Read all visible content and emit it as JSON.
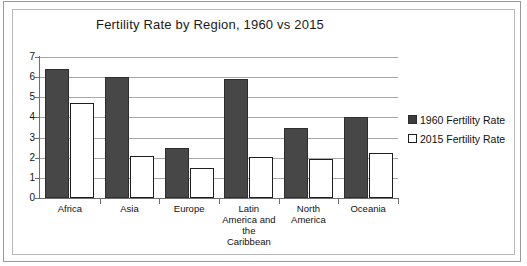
{
  "chart_data": {
    "type": "bar",
    "title": "Fertility Rate by Region, 1960 vs 2015",
    "xlabel": "",
    "ylabel": "",
    "ylim": [
      0,
      7
    ],
    "ytick_labels": [
      "7",
      "6",
      "5",
      "4",
      "3",
      "2",
      "1",
      "0"
    ],
    "ytick_values": [
      7,
      6,
      5,
      4,
      3,
      2,
      1,
      0
    ],
    "grid": true,
    "legend_position": "right",
    "categories": [
      "Africa",
      "Asia",
      "Europe",
      "Latin America and the Caribbean",
      "North America",
      "Oceania"
    ],
    "category_label_lines": [
      [
        "Africa"
      ],
      [
        "Asia"
      ],
      [
        "Europe"
      ],
      [
        "Latin",
        "America and",
        "the",
        "Caribbean"
      ],
      [
        "North",
        "America"
      ],
      [
        "Oceania"
      ]
    ],
    "series": [
      {
        "name": "1960 Fertility Rate",
        "color": "#474747",
        "values": [
          6.4,
          6.0,
          2.5,
          5.9,
          3.5,
          4.0
        ]
      },
      {
        "name": "2015 Fertility Rate",
        "color": "#ffffff",
        "values": [
          4.7,
          2.1,
          1.5,
          2.05,
          1.95,
          2.25
        ]
      }
    ]
  },
  "legend": {
    "items": [
      {
        "label": "1960 Fertility Rate"
      },
      {
        "label": "2015 Fertility Rate"
      }
    ]
  },
  "colors": {
    "series_1960": "#474747",
    "series_2015": "#ffffff",
    "gridline": "#a8a8a8",
    "axis": "#6f6f6f",
    "frame": "#b9b9b9",
    "page_border": "#9a9a9a",
    "text": "#111111"
  }
}
